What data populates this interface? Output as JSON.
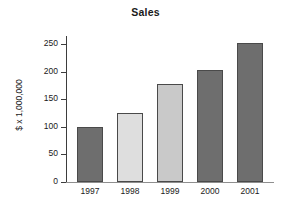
{
  "chart_data": {
    "type": "bar",
    "title": "Sales",
    "xlabel": "",
    "ylabel": "$ x 1,000,000",
    "categories": [
      "1997",
      "1998",
      "1999",
      "2000",
      "2001"
    ],
    "values": [
      100,
      125,
      178,
      203,
      253
    ],
    "ylim": [
      0,
      265
    ],
    "yticks": [
      0,
      50,
      100,
      150,
      200,
      250
    ],
    "ytick_labels": [
      "0",
      "50",
      "100",
      "150",
      "200",
      "250"
    ],
    "grid": false,
    "legend": null,
    "bar_colors": [
      "#6e6e6e",
      "#dedede",
      "#c9c9c9",
      "#6e6e6e",
      "#6e6e6e"
    ],
    "bar_edge_color": "#4a4a4a",
    "axis_color": "#3d3d3d",
    "baseline_color": "#8f8f8f",
    "background": "#ffffff"
  }
}
